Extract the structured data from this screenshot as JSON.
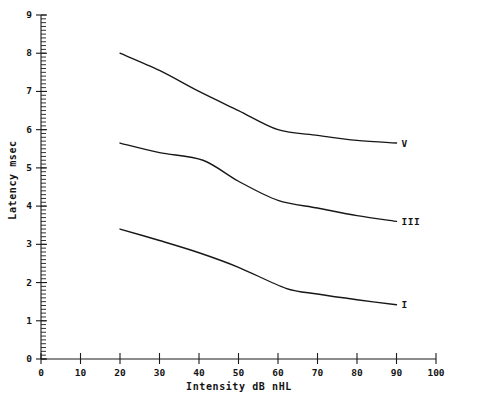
{
  "chart_data": {
    "type": "line",
    "title": "",
    "subtitle": "",
    "xlabel": "Intensity dB nHL",
    "ylabel": "Latency  msec",
    "xlim": [
      0,
      100
    ],
    "ylim": [
      0,
      9
    ],
    "xticks": [
      0,
      10,
      20,
      30,
      40,
      50,
      60,
      70,
      80,
      90,
      100
    ],
    "xtick_labels": [
      "0",
      "10",
      "20",
      "30",
      "40",
      "50",
      "60",
      "70",
      "80",
      "90",
      "100"
    ],
    "yticks": [
      0,
      1,
      2,
      3,
      4,
      5,
      6,
      7,
      8,
      9
    ],
    "ytick_labels": [
      "0",
      "1",
      "2",
      "3",
      "4",
      "5",
      "6",
      "7",
      "8",
      "9"
    ],
    "x_minor_step": 2,
    "y_minor_step": 0.1,
    "grid": false,
    "legend": "inline-right-end-labels",
    "line_color": "#171717",
    "axis_color": "#1a1a1a",
    "background": "#ffffff",
    "series": [
      {
        "name": "V",
        "label": "V",
        "x": [
          20,
          30,
          40,
          50,
          60,
          70,
          80,
          90
        ],
        "values": [
          8.0,
          7.55,
          7.0,
          6.5,
          6.0,
          5.85,
          5.72,
          5.65
        ]
      },
      {
        "name": "III",
        "label": "III",
        "x": [
          20,
          30,
          41,
          50,
          60,
          70,
          80,
          90
        ],
        "values": [
          5.65,
          5.4,
          5.2,
          4.65,
          4.15,
          3.95,
          3.75,
          3.6
        ]
      },
      {
        "name": "I",
        "label": "I",
        "x": [
          20,
          30,
          40,
          50,
          62,
          70,
          80,
          90
        ],
        "values": [
          3.4,
          3.1,
          2.78,
          2.4,
          1.85,
          1.7,
          1.55,
          1.42
        ]
      }
    ]
  },
  "labels": {
    "series_v": "V",
    "series_iii": "III",
    "series_i": "I"
  }
}
